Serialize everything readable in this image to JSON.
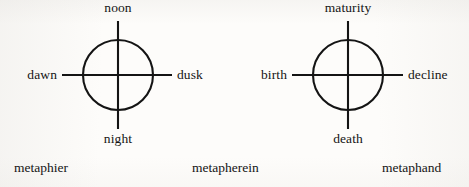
{
  "figure": {
    "name": "metaphor-structure-diagram",
    "background_color": "#fdfcfa",
    "ink_color": "#141414",
    "width": 469,
    "height": 187
  },
  "diagrams": [
    {
      "id": "time-of-day-diagram",
      "icon": "cross-in-circle-icon",
      "center_x": 118,
      "center_y": 75,
      "radius": 35,
      "labels": {
        "top": "noon",
        "right": "dusk",
        "bottom": "night",
        "left": "dawn"
      }
    },
    {
      "id": "life-stage-diagram",
      "icon": "cross-in-circle-icon",
      "center_x": 348,
      "center_y": 75,
      "radius": 35,
      "labels": {
        "top": "maturity",
        "right": "decline",
        "bottom": "death",
        "left": "birth"
      }
    }
  ],
  "captions": [
    {
      "id": "caption-metaphier",
      "text": "metaphier",
      "x": 14
    },
    {
      "id": "caption-metapherein",
      "text": "metapherein",
      "x": 192
    },
    {
      "id": "caption-metaphand",
      "text": "metaphand",
      "x": 382
    }
  ]
}
